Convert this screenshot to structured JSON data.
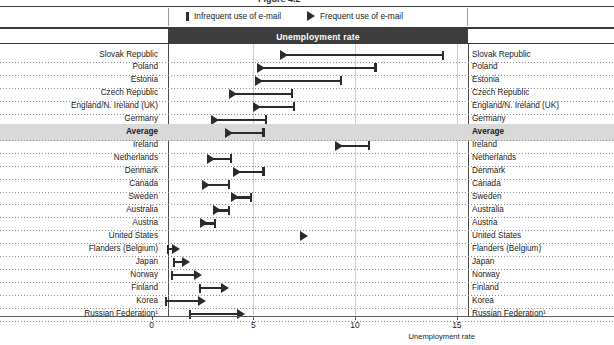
{
  "figure": {
    "cropped_caption": "Figure 4.2",
    "band_title": "Unemployment rate",
    "axis_title": "Unemployment rate",
    "legend": [
      {
        "label": "Infrequent use of e-mail",
        "marker": "bar-icon"
      },
      {
        "label": "Frequent use of e-mail",
        "marker": "triangle-icon"
      }
    ]
  },
  "chart_data": {
    "type": "bar",
    "title": "Unemployment rate",
    "xlabel": "Unemployment rate",
    "ylabel": "",
    "xlim": [
      0,
      15.8
    ],
    "ticks": [
      0,
      5,
      10,
      15
    ],
    "grid": true,
    "legend_position": "top",
    "series": [
      {
        "name": "Frequent use of e-mail",
        "marker": "triangle"
      },
      {
        "name": "Infrequent use of e-mail",
        "marker": "bar"
      }
    ],
    "categories": [
      "Slovak Republic",
      "Poland",
      "Estonia",
      "Czech Republic",
      "England/N. Ireland (UK)",
      "Germany",
      "Average",
      "Ireland",
      "Netherlands",
      "Denmark",
      "Canada",
      "Sweden",
      "Australia",
      "Austria",
      "United States",
      "Flanders (Belgium)",
      "Japan",
      "Norway",
      "Finland",
      "Korea",
      "Russian Federation¹"
    ],
    "rows": [
      {
        "category": "Slovak Republic",
        "frequent": 6.5,
        "infrequent": 14.3,
        "highlight": false
      },
      {
        "category": "Poland",
        "frequent": 5.4,
        "infrequent": 11.0,
        "highlight": false
      },
      {
        "category": "Estonia",
        "frequent": 5.3,
        "infrequent": 9.3,
        "highlight": false
      },
      {
        "category": "Czech Republic",
        "frequent": 4.0,
        "infrequent": 6.9,
        "highlight": false
      },
      {
        "category": "England/N. Ireland (UK)",
        "frequent": 5.2,
        "infrequent": 7.0,
        "highlight": false
      },
      {
        "category": "Germany",
        "frequent": 3.1,
        "infrequent": 5.6,
        "highlight": false
      },
      {
        "category": "Average",
        "frequent": 3.8,
        "infrequent": 5.5,
        "highlight": true
      },
      {
        "category": "Ireland",
        "frequent": 9.2,
        "infrequent": 10.7,
        "highlight": false
      },
      {
        "category": "Netherlands",
        "frequent": 2.9,
        "infrequent": 3.9,
        "highlight": false
      },
      {
        "category": "Denmark",
        "frequent": 4.2,
        "infrequent": 5.5,
        "highlight": false
      },
      {
        "category": "Canada",
        "frequent": 2.7,
        "infrequent": 3.8,
        "highlight": false
      },
      {
        "category": "Sweden",
        "frequent": 4.1,
        "infrequent": 4.9,
        "highlight": false
      },
      {
        "category": "Australia",
        "frequent": 3.2,
        "infrequent": 3.8,
        "highlight": false
      },
      {
        "category": "Austria",
        "frequent": 2.6,
        "infrequent": 3.1,
        "highlight": false
      },
      {
        "category": "United States",
        "frequent": 7.5,
        "infrequent": null,
        "highlight": false
      },
      {
        "category": "Flanders (Belgium)",
        "frequent": 1.2,
        "infrequent": 0.8,
        "highlight": false
      },
      {
        "category": "Japan",
        "frequent": 1.7,
        "infrequent": 1.1,
        "highlight": false
      },
      {
        "category": "Norway",
        "frequent": 2.3,
        "infrequent": 1.0,
        "highlight": false
      },
      {
        "category": "Finland",
        "frequent": 3.6,
        "infrequent": 2.4,
        "highlight": false
      },
      {
        "category": "Korea",
        "frequent": 2.5,
        "infrequent": 0.7,
        "highlight": false
      },
      {
        "category": "Russian Federation¹",
        "frequent": 4.4,
        "infrequent": 1.9,
        "highlight": false
      }
    ]
  }
}
